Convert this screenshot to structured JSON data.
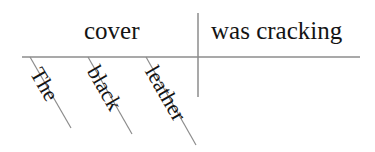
{
  "diagram": {
    "type": "reed-kellogg-sentence-diagram",
    "sentence": "The black leather cover was cracking",
    "background_color": "#ffffff",
    "line_color": "#8c8c8c",
    "text_color": "#141414",
    "baseline": {
      "label": "main-horizontal-baseline",
      "x1": 22,
      "y1": 57,
      "x2": 360,
      "y2": 57
    },
    "divider": {
      "label": "subject-predicate-divider",
      "x": 198,
      "y1": 13,
      "y2": 97
    },
    "subject": {
      "word": "cover",
      "role": "simple subject"
    },
    "predicate": {
      "word": "was cracking",
      "role": "verb phrase"
    },
    "modifiers": [
      {
        "word": "The",
        "role": "article",
        "slant": {
          "x1": 30,
          "y1": 57,
          "x2": 71,
          "y2": 128
        }
      },
      {
        "word": "black",
        "role": "adjective",
        "slant": {
          "x1": 88,
          "y1": 57,
          "x2": 132,
          "y2": 134
        }
      },
      {
        "word": "leather",
        "role": "adjective",
        "slant": {
          "x1": 146,
          "y1": 57,
          "x2": 196,
          "y2": 145
        }
      }
    ]
  }
}
